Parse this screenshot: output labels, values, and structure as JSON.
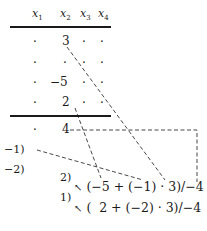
{
  "header": {
    "columns": [
      {
        "var": "x",
        "sub": "1"
      },
      {
        "var": "x",
        "sub": "2"
      },
      {
        "var": "x",
        "sub": "3"
      },
      {
        "var": "x",
        "sub": "4"
      }
    ]
  },
  "rows": [
    {
      "cells": [
        "·",
        "3",
        "·",
        "·"
      ]
    },
    {
      "cells": [
        "·",
        "·",
        "·",
        "·"
      ]
    },
    {
      "cells": [
        "·",
        "−5",
        "·",
        "·"
      ]
    },
    {
      "cells": [
        "·",
        "2",
        "·",
        "·"
      ]
    }
  ],
  "result_row": {
    "cells": [
      "·",
      "4"
    ]
  },
  "multipliers": [
    {
      "label": "−1)"
    },
    {
      "label": "−2)"
    }
  ],
  "steps": [
    {
      "label": "2)",
      "arrow": "↖",
      "expression": "(−5 + (−1) · 3)/−4"
    },
    {
      "label": "1)",
      "arrow": "↖",
      "expression": "(  2 + (−2) · 3)/−4"
    }
  ],
  "colors": {
    "ink": "#1a1a1a",
    "background": "#ffffff"
  }
}
